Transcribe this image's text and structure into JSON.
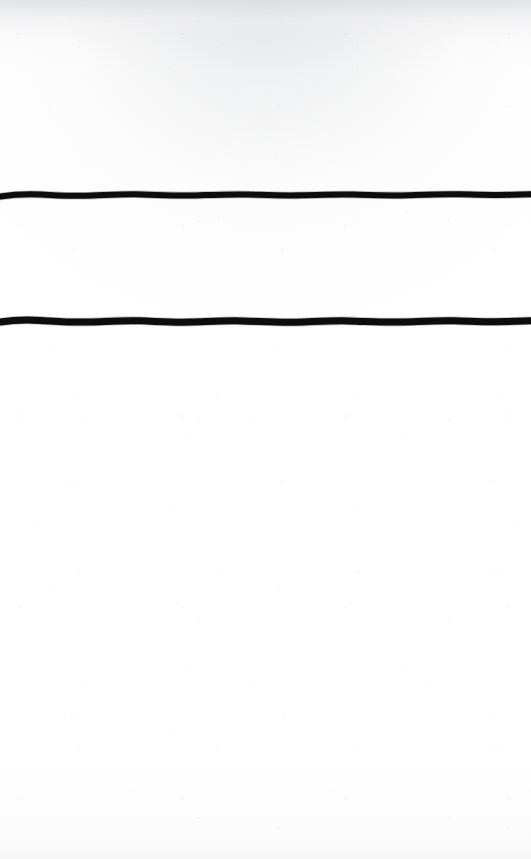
{
  "document": {
    "kind": "scanned-blank-page",
    "page_width": 531,
    "page_height": 859,
    "background_color": "#fefefe",
    "paper_tint_top": "#f1f1f2",
    "ink_color": "#0b0b0c",
    "visible_text": "",
    "note": ""
  },
  "marks": {
    "count": 2,
    "items": [
      {
        "name": "horizontal-rule-upper",
        "shape": "hand-drawn-horizontal-line",
        "color": "#0b0b0c",
        "center_y": 195,
        "thickness": 6,
        "x_start": 0,
        "x_end": 531,
        "full_bleed": true
      },
      {
        "name": "horizontal-rule-lower",
        "shape": "hand-drawn-horizontal-line",
        "color": "#0b0b0c",
        "center_y": 322,
        "thickness": 7,
        "x_start": 0,
        "x_end": 531,
        "full_bleed": true
      }
    ],
    "gap_between_rules": 127
  },
  "regions": {
    "above_upper_rule": "blank",
    "between_rules": "blank",
    "below_lower_rule": "blank"
  }
}
